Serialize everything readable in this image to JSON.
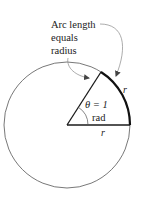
{
  "diagram": {
    "annotation_lines": [
      "Arc length",
      "equals",
      "radius"
    ],
    "theta_label": "θ = 1",
    "unit_label": "rad",
    "arc_radius_label": "r",
    "base_radius_label": "r",
    "colors": {
      "circle": "#555555",
      "radius": "#1a1a1a",
      "arc": "#111111",
      "arrow": "#888888",
      "text": "#222222"
    }
  }
}
